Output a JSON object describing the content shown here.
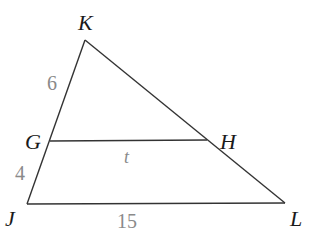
{
  "diagram": {
    "type": "triangle-with-parallel-segment",
    "stroke_color": "#333333",
    "label_color": "#1a1a1a",
    "measure_color": "#8a8a8a",
    "vertices": {
      "K": {
        "label": "K",
        "x": 85,
        "y": 40
      },
      "G": {
        "label": "G",
        "x": 50,
        "y": 141
      },
      "H": {
        "label": "H",
        "x": 207,
        "y": 141
      },
      "J": {
        "label": "J",
        "x": 27,
        "y": 204
      },
      "L": {
        "label": "L",
        "x": 285,
        "y": 203
      }
    },
    "measures": {
      "KG": "6",
      "GJ": "4",
      "GH": "t",
      "JL": "15"
    }
  }
}
